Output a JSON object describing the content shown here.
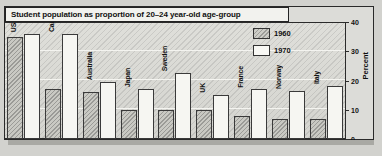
{
  "chart_data": {
    "type": "bar",
    "title": "Student population as proportion of 20–24 year-old age-group",
    "xlabel": "",
    "ylabel": "Percent",
    "ylim": [
      0,
      40
    ],
    "yticks": [
      "0",
      "10",
      "20",
      "30",
      "40"
    ],
    "grid": true,
    "legend_position": "upper-right",
    "categories": [
      "USA",
      "Canada",
      "Australia",
      "Japan",
      "Sweden",
      "UK",
      "France",
      "Norway",
      "Italy"
    ],
    "series": [
      {
        "name": "1960",
        "values": [
          35,
          17,
          16,
          10,
          10,
          10,
          8,
          7,
          7
        ]
      },
      {
        "name": "1970",
        "values": [
          36,
          36,
          19.5,
          17,
          22.5,
          15,
          17,
          16.5,
          18
        ]
      }
    ]
  },
  "title": {
    "text": "Student population as proportion of 20–24 year-old age-group"
  },
  "legend": {
    "items": [
      {
        "label": "1960",
        "swatch": "hatched-swatch"
      },
      {
        "label": "1970",
        "swatch": "white-swatch"
      }
    ]
  },
  "axis": {
    "y_title": "Percent",
    "y_ticks": [
      "0",
      "10",
      "20",
      "30",
      "40"
    ]
  },
  "colors": {
    "frame": "#2a2a2a",
    "plot_background": "#dadad5",
    "bar_1960": "#c9c9c3",
    "bar_1970": "#f6f6f2",
    "gridline": "#f4f4f0",
    "page_background": "#cfcfcb"
  }
}
